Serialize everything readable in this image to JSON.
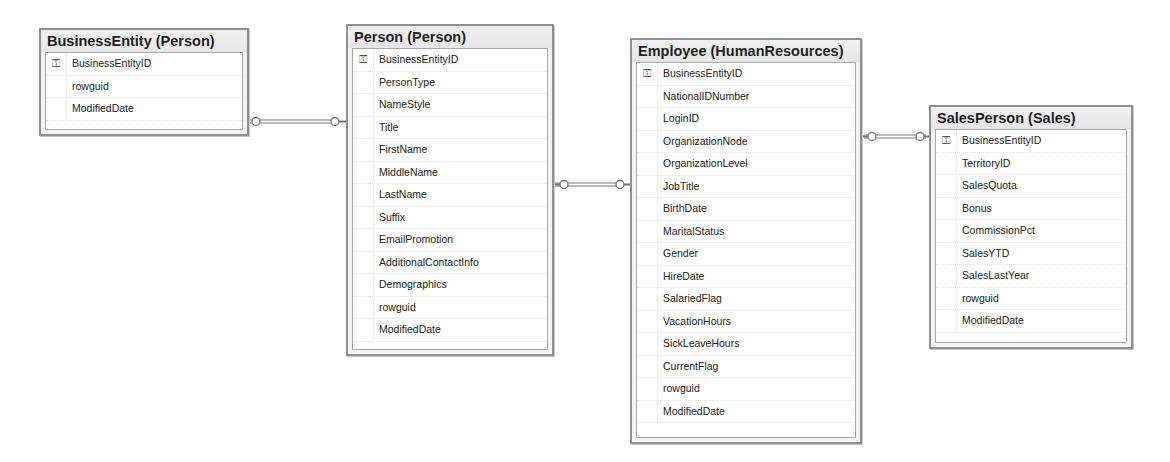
{
  "diagram": {
    "tables": [
      {
        "id": "business-entity",
        "title": "BusinessEntity (Person)",
        "columns": [
          {
            "name": "BusinessEntityID",
            "key": true
          },
          {
            "name": "rowguid",
            "key": false
          },
          {
            "name": "ModifiedDate",
            "key": false
          }
        ]
      },
      {
        "id": "person",
        "title": "Person (Person)",
        "columns": [
          {
            "name": "BusinessEntityID",
            "key": true
          },
          {
            "name": "PersonType",
            "key": false
          },
          {
            "name": "NameStyle",
            "key": false
          },
          {
            "name": "Title",
            "key": false
          },
          {
            "name": "FirstName",
            "key": false
          },
          {
            "name": "MiddleName",
            "key": false
          },
          {
            "name": "LastName",
            "key": false
          },
          {
            "name": "Suffix",
            "key": false
          },
          {
            "name": "EmailPromotion",
            "key": false
          },
          {
            "name": "AdditionalContactInfo",
            "key": false
          },
          {
            "name": "Demographics",
            "key": false
          },
          {
            "name": "rowguid",
            "key": false
          },
          {
            "name": "ModifiedDate",
            "key": false
          }
        ]
      },
      {
        "id": "employee",
        "title": "Employee (HumanResources)",
        "columns": [
          {
            "name": "BusinessEntityID",
            "key": true
          },
          {
            "name": "NationalIDNumber",
            "key": false
          },
          {
            "name": "LoginID",
            "key": false
          },
          {
            "name": "OrganizationNode",
            "key": false
          },
          {
            "name": "OrganizationLevel",
            "key": false
          },
          {
            "name": "JobTitle",
            "key": false
          },
          {
            "name": "BirthDate",
            "key": false
          },
          {
            "name": "MaritalStatus",
            "key": false
          },
          {
            "name": "Gender",
            "key": false
          },
          {
            "name": "HireDate",
            "key": false
          },
          {
            "name": "SalariedFlag",
            "key": false
          },
          {
            "name": "VacationHours",
            "key": false
          },
          {
            "name": "SickLeaveHours",
            "key": false
          },
          {
            "name": "CurrentFlag",
            "key": false
          },
          {
            "name": "rowguid",
            "key": false
          },
          {
            "name": "ModifiedDate",
            "key": false
          }
        ]
      },
      {
        "id": "sales-person",
        "title": "SalesPerson (Sales)",
        "columns": [
          {
            "name": "BusinessEntityID",
            "key": true
          },
          {
            "name": "TerritoryID",
            "key": false
          },
          {
            "name": "SalesQuota",
            "key": false
          },
          {
            "name": "Bonus",
            "key": false
          },
          {
            "name": "CommissionPct",
            "key": false
          },
          {
            "name": "SalesYTD",
            "key": false
          },
          {
            "name": "SalesLastYear",
            "key": false
          },
          {
            "name": "rowguid",
            "key": false
          },
          {
            "name": "ModifiedDate",
            "key": false
          }
        ]
      }
    ],
    "relationships": [
      {
        "from": "BusinessEntity (Person)",
        "to": "Person (Person)",
        "icon": "key-key-connector"
      },
      {
        "from": "Person (Person)",
        "to": "Employee (HumanResources)",
        "icon": "key-key-connector"
      },
      {
        "from": "Employee (HumanResources)",
        "to": "SalesPerson (Sales)",
        "icon": "key-key-connector"
      }
    ],
    "key_glyph": "⚿"
  }
}
